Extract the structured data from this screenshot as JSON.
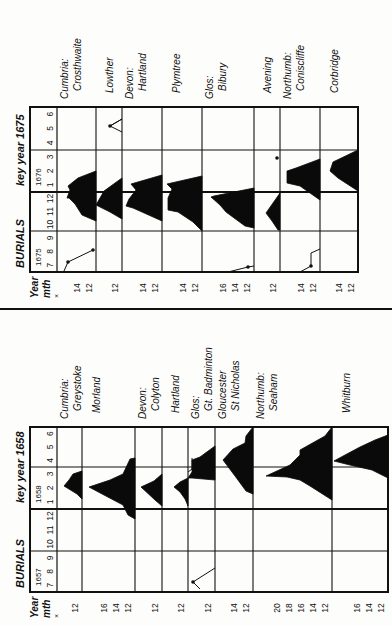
{
  "chart_data": [
    {
      "type": "area",
      "title": "BURIALS key year 1675",
      "panel": "top",
      "header": {
        "label": "BURIALS",
        "key_label": "key year 1675"
      },
      "axis_labels": {
        "year": "Year",
        "month": "mth",
        "multiplier": "×"
      },
      "year_groups": [
        {
          "year": "1675",
          "months": [
            "7",
            "8",
            "9"
          ]
        },
        {
          "year": "",
          "months": [
            "10",
            "11",
            "12"
          ]
        },
        {
          "year": "1676",
          "months": [
            "1",
            "2",
            "3"
          ]
        },
        {
          "year": "",
          "months": [
            "4",
            "5",
            "6"
          ]
        }
      ],
      "rows": [
        {
          "county": "Cumbria:",
          "parish": "Crosthwaite",
          "ticks": [
            "14",
            "12"
          ]
        },
        {
          "county": "",
          "parish": "Lowther",
          "ticks": [
            "12"
          ]
        },
        {
          "county": "Devon:",
          "parish": "Hartland",
          "ticks": [
            "14",
            "12"
          ]
        },
        {
          "county": "",
          "parish": "Plymtree",
          "ticks": [
            "14",
            "12"
          ]
        },
        {
          "county": "Glos:",
          "parish": "Bibury",
          "ticks": [
            "16",
            "14",
            "12"
          ]
        },
        {
          "county": "",
          "parish": "Avening",
          "ticks": [
            "12"
          ]
        },
        {
          "county": "Northumb:",
          "parish": "Coniscliffe",
          "ticks": [
            "14",
            "12"
          ]
        },
        {
          "county": "",
          "parish": "Corbridge",
          "ticks": [
            "14",
            "12"
          ]
        }
      ]
    },
    {
      "type": "area",
      "title": "BURIALS key year 1658",
      "panel": "bottom",
      "header": {
        "label": "BURIALS",
        "key_label": "key year 1658"
      },
      "axis_labels": {
        "year": "Year",
        "month": "mth",
        "multiplier": "×"
      },
      "year_groups": [
        {
          "year": "1657",
          "months": [
            "7",
            "8",
            "9"
          ]
        },
        {
          "year": "",
          "months": [
            "10",
            "11",
            "12"
          ]
        },
        {
          "year": "1658",
          "months": [
            "1",
            "2",
            "3"
          ]
        },
        {
          "year": "",
          "months": [
            "4",
            "5",
            "6"
          ]
        }
      ],
      "rows": [
        {
          "county": "Cumbria:",
          "parish": "Greystoke",
          "ticks": [
            "12"
          ]
        },
        {
          "county": "",
          "parish": "Morland",
          "ticks": [
            "16",
            "14",
            "12"
          ]
        },
        {
          "county": "Devon:",
          "parish": "Colyton",
          "ticks": [
            "12"
          ]
        },
        {
          "county": "",
          "parish": "Hartland",
          "ticks": [
            "12"
          ]
        },
        {
          "county": "Glos:",
          "parish": "Gt. Badminton",
          "ticks": [
            "12"
          ]
        },
        {
          "county": "Gloucester",
          "parish": "St Nicholas",
          "ticks": [
            "14",
            "12"
          ]
        },
        {
          "county": "Northumb:",
          "parish": "Seaham",
          "ticks": [
            "20",
            "18",
            "16",
            "14",
            "12"
          ]
        },
        {
          "county": "",
          "parish": "Whitburn",
          "ticks": [
            "16",
            "14",
            "12"
          ]
        }
      ]
    }
  ]
}
